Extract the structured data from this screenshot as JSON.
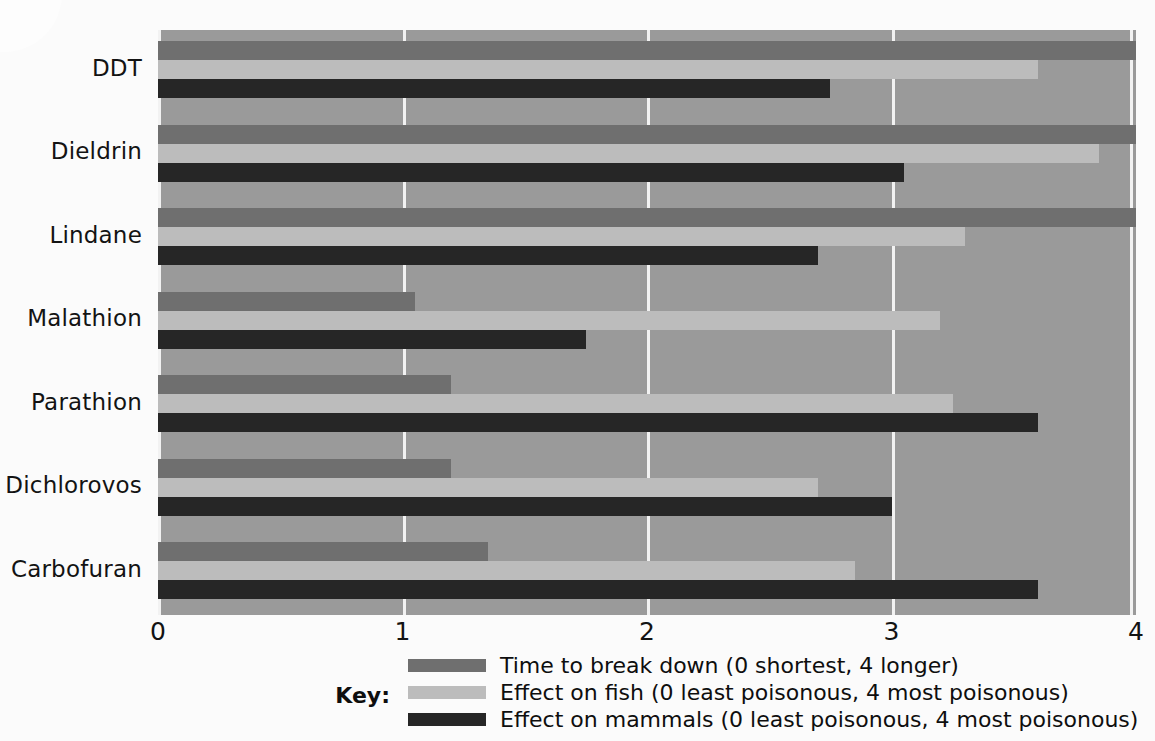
{
  "chart_data": {
    "type": "bar",
    "orientation": "horizontal",
    "title": "",
    "xlabel": "",
    "ylabel": "",
    "categories": [
      "DDT",
      "Dieldrin",
      "Lindane",
      "Malathion",
      "Parathion",
      "Dichlorovos",
      "Carbofuran"
    ],
    "series": [
      {
        "name": "Time to break down (0 shortest, 4 longer)",
        "color": "#6f6f6f",
        "values": [
          4.0,
          4.0,
          4.0,
          1.05,
          1.2,
          1.2,
          1.35
        ]
      },
      {
        "name": "Effect on fish (0 least poisonous, 4 most poisonous)",
        "color": "#bcbcbc",
        "values": [
          3.6,
          3.85,
          3.3,
          3.2,
          3.25,
          2.7,
          2.85
        ]
      },
      {
        "name": "Effect on mammals (0 least poisonous, 4 most poisonous)",
        "color": "#262626",
        "values": [
          2.75,
          3.05,
          2.7,
          1.75,
          3.6,
          3.0,
          3.6
        ]
      }
    ],
    "xlim": [
      0,
      4
    ],
    "xticks": [
      "0",
      "1",
      "2",
      "3",
      "4"
    ],
    "xtick_values": [
      0,
      1,
      2,
      3,
      4
    ],
    "grid": true,
    "legend_position": "bottom"
  },
  "axes": {
    "y_categories": [
      {
        "label": "DDT"
      },
      {
        "label": "Dieldrin"
      },
      {
        "label": "Lindane"
      },
      {
        "label": "Malathion"
      },
      {
        "label": "Parathion"
      },
      {
        "label": "Dichlorovos"
      },
      {
        "label": "Carbofuran"
      }
    ],
    "x_ticks": [
      {
        "label": "0"
      },
      {
        "label": "1"
      },
      {
        "label": "2"
      },
      {
        "label": "3"
      },
      {
        "label": "4"
      }
    ]
  },
  "legend": {
    "key_label": "Key:",
    "entries": [
      {
        "label": "Time to break down (0 shortest, 4 longer)",
        "color": "#6f6f6f"
      },
      {
        "label": "Effect on fish (0 least poisonous, 4 most poisonous)",
        "color": "#bcbcbc"
      },
      {
        "label": "Effect on mammals (0 least poisonous, 4 most poisonous)",
        "color": "#262626"
      }
    ]
  },
  "colors": {
    "plot_background": "#9a9a9a",
    "gridline": "#f2f2f2",
    "page_background": "#fbfbfb",
    "text": "#131313"
  }
}
